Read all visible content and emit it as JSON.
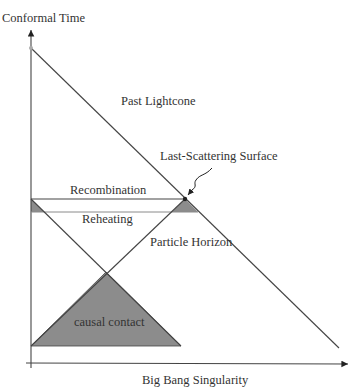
{
  "diagram": {
    "axes": {
      "y_label": "Conformal Time",
      "x_label": "Big Bang Singularity"
    },
    "labels": {
      "past_lightcone": "Past Lightcone",
      "last_scattering": "Last-Scattering Surface",
      "recombination": "Recombination",
      "reheating": "Reheating",
      "particle_horizon": "Particle Horizon",
      "causal_contact": "causal contact"
    },
    "colors": {
      "line": "#444444",
      "shade": "#8c8c8c",
      "light_line": "#8a8a8a",
      "text": "#333333"
    }
  }
}
